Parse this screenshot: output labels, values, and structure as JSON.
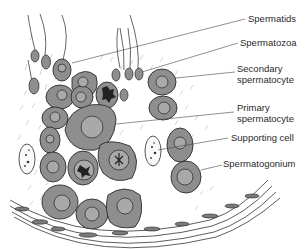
{
  "figure": {
    "type": "diagram",
    "colors": {
      "cell_fill": "#8e8e8e",
      "cell_stroke": "#2b2b2b",
      "nucleus_fill": "#a9a9a9",
      "background": "#ffffff",
      "line": "#444444"
    }
  },
  "labels": [
    {
      "id": "spermatids",
      "text": "Spermatids"
    },
    {
      "id": "spermatozoa",
      "text": "Spermatozoa"
    },
    {
      "id": "secondary-spermatocyte",
      "line1": "Secondary",
      "line2": "spermatocyte"
    },
    {
      "id": "primary-spermatocyte",
      "line1": "Primary",
      "line2": "spermatocyte"
    },
    {
      "id": "supporting-cell",
      "text": "Supporting cell"
    },
    {
      "id": "spermatogonium",
      "text": "Spermatogonium"
    }
  ]
}
